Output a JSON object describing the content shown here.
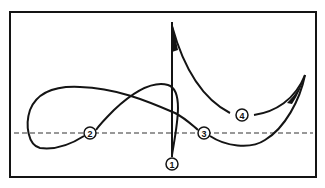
{
  "diagram": {
    "type": "annotated-curve",
    "colors": {
      "stroke": "#141414",
      "background": "#ffffff",
      "dashed_line": "#333333"
    },
    "frame": {
      "x": 10,
      "y": 12,
      "width": 306,
      "height": 165
    },
    "baseline": {
      "style": "dashed",
      "y": 133,
      "x1": 14,
      "x2": 313
    },
    "markers": [
      {
        "id": "1",
        "label": "1",
        "x": 172,
        "y": 164
      },
      {
        "id": "2",
        "label": "2",
        "x": 90,
        "y": 133
      },
      {
        "id": "3",
        "label": "3",
        "x": 204,
        "y": 133
      },
      {
        "id": "4",
        "label": "4",
        "x": 242,
        "y": 115
      }
    ]
  }
}
